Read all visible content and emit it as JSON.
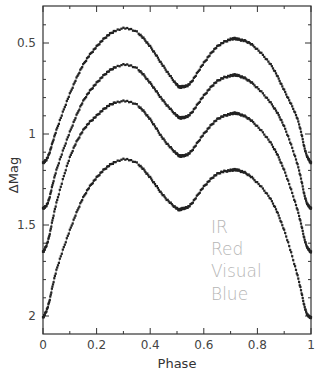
{
  "chart_data": {
    "type": "line",
    "title": "",
    "xlabel": "Phase",
    "ylabel": "ΔMag",
    "xlim": [
      0,
      1
    ],
    "ylim": [
      2.1,
      0.38
    ],
    "y_inverted": true,
    "grid": false,
    "x_ticks": [
      0,
      0.2,
      0.4,
      0.6,
      0.8,
      1
    ],
    "x_tick_labels": [
      "0",
      "0.2",
      "0.4",
      "0.6",
      "0.8",
      "1"
    ],
    "x_minor_step": 0.1,
    "y_ticks": [
      0.5,
      1,
      1.5,
      2
    ],
    "y_tick_labels": [
      "0.5",
      "1",
      "1.5",
      "2"
    ],
    "y_minor_step": 0.1,
    "legend_position": "lower right, stacked text",
    "x": [
      0,
      0.02,
      0.05,
      0.1,
      0.15,
      0.2,
      0.25,
      0.3,
      0.35,
      0.4,
      0.45,
      0.5,
      0.52,
      0.55,
      0.6,
      0.65,
      0.7,
      0.73,
      0.78,
      0.85,
      0.9,
      0.95,
      0.98,
      1
    ],
    "series": [
      {
        "name": "IR",
        "values": [
          1.16,
          1.12,
          0.98,
          0.78,
          0.62,
          0.52,
          0.45,
          0.42,
          0.44,
          0.52,
          0.63,
          0.73,
          0.74,
          0.72,
          0.61,
          0.52,
          0.48,
          0.48,
          0.51,
          0.62,
          0.76,
          0.92,
          1.1,
          1.16
        ]
      },
      {
        "name": "Red",
        "values": [
          1.41,
          1.37,
          1.2,
          0.99,
          0.82,
          0.72,
          0.65,
          0.62,
          0.64,
          0.72,
          0.82,
          0.9,
          0.91,
          0.89,
          0.79,
          0.71,
          0.68,
          0.68,
          0.72,
          0.83,
          0.96,
          1.17,
          1.36,
          1.41
        ]
      },
      {
        "name": "Visual",
        "values": [
          1.65,
          1.58,
          1.38,
          1.13,
          0.98,
          0.9,
          0.84,
          0.82,
          0.84,
          0.92,
          1.03,
          1.11,
          1.12,
          1.1,
          1.0,
          0.92,
          0.89,
          0.89,
          0.93,
          1.05,
          1.2,
          1.42,
          1.6,
          1.65
        ]
      },
      {
        "name": "Blue",
        "values": [
          2.01,
          1.94,
          1.75,
          1.53,
          1.35,
          1.24,
          1.17,
          1.14,
          1.16,
          1.24,
          1.34,
          1.41,
          1.41,
          1.39,
          1.29,
          1.22,
          1.2,
          1.2,
          1.24,
          1.36,
          1.53,
          1.78,
          1.97,
          2.01
        ]
      }
    ],
    "legend": [
      "IR",
      "Red",
      "Visual",
      "Blue"
    ]
  },
  "colors": {
    "points": "#222222",
    "fit_line": "#888888",
    "axis": "#333333",
    "legend_text": "#b5b5b5"
  }
}
